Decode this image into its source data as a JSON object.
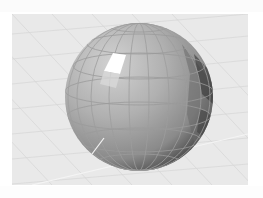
{
  "top_caption": "",
  "bottom_caption": "",
  "viewport": {
    "background": "#e9e9e9",
    "grid_color": "#d4d4d4",
    "object": {
      "type": "sphere",
      "shading": "faceted",
      "base_color": "#a9a9a9",
      "highlight_color": "#ffffff",
      "shadow_color": "#3a3a3a"
    }
  }
}
